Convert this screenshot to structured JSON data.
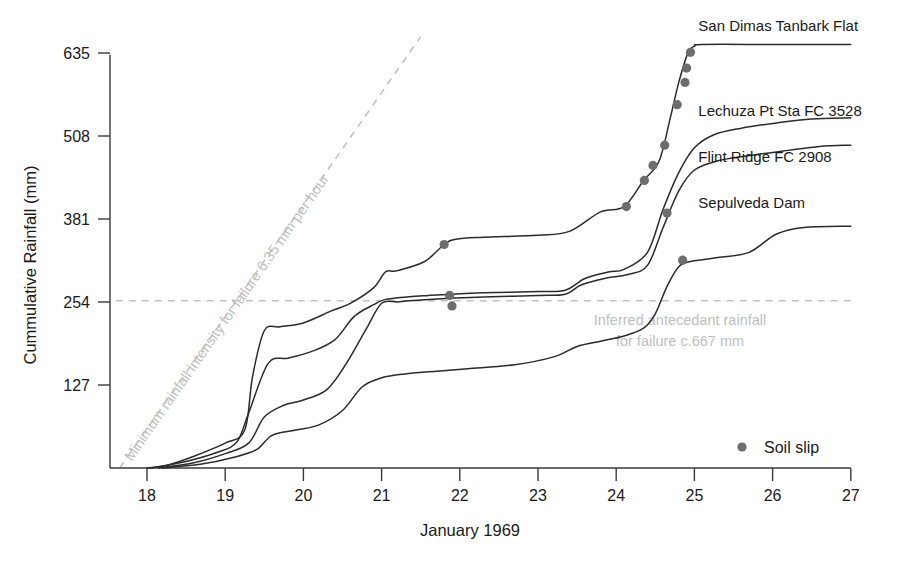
{
  "chart_data": {
    "type": "line",
    "title": "",
    "subtitle": "",
    "xlabel": "January 1969",
    "ylabel": "Cummulative Rainfall (mm)",
    "xlim": [
      17.6,
      27.0
    ],
    "ylim": [
      0,
      660
    ],
    "xticks": [
      "18",
      "19",
      "20",
      "21",
      "22",
      "23",
      "24",
      "25",
      "26",
      "27"
    ],
    "xtick_values": [
      18,
      19,
      20,
      21,
      22,
      23,
      24,
      25,
      26,
      27
    ],
    "yticks": [
      "127",
      "254",
      "381",
      "508",
      "635"
    ],
    "ytick_values": [
      127,
      254,
      381,
      508,
      635
    ],
    "grid": false,
    "legend_position": "bottom-right",
    "series": [
      {
        "name": "San Dimas Tanbark Flat",
        "label_x": 25.05,
        "label_y": 668,
        "points": [
          [
            18.0,
            0
          ],
          [
            18.25,
            4
          ],
          [
            18.6,
            18
          ],
          [
            19.0,
            38
          ],
          [
            19.25,
            58
          ],
          [
            19.35,
            140
          ],
          [
            19.5,
            210
          ],
          [
            19.7,
            216
          ],
          [
            20.0,
            222
          ],
          [
            20.35,
            240
          ],
          [
            20.6,
            252
          ],
          [
            20.9,
            276
          ],
          [
            21.05,
            300
          ],
          [
            21.2,
            302
          ],
          [
            21.55,
            316
          ],
          [
            21.8,
            342
          ],
          [
            21.95,
            350
          ],
          [
            22.3,
            353
          ],
          [
            23.0,
            356
          ],
          [
            23.4,
            362
          ],
          [
            23.8,
            392
          ],
          [
            24.1,
            400
          ],
          [
            24.35,
            440
          ],
          [
            24.55,
            470
          ],
          [
            24.7,
            540
          ],
          [
            24.8,
            590
          ],
          [
            24.92,
            636
          ],
          [
            25.0,
            645
          ],
          [
            25.1,
            648
          ],
          [
            26.0,
            648
          ],
          [
            27.0,
            648
          ]
        ]
      },
      {
        "name": "Lechuza Pt Sta FC 3528",
        "label_x": 25.05,
        "label_y": 538,
        "points": [
          [
            18.05,
            0
          ],
          [
            18.5,
            10
          ],
          [
            18.9,
            24
          ],
          [
            19.15,
            40
          ],
          [
            19.3,
            84
          ],
          [
            19.55,
            160
          ],
          [
            19.8,
            168
          ],
          [
            20.1,
            178
          ],
          [
            20.4,
            196
          ],
          [
            20.65,
            232
          ],
          [
            20.9,
            250
          ],
          [
            21.05,
            258
          ],
          [
            21.35,
            262
          ],
          [
            21.6,
            264
          ],
          [
            21.9,
            266
          ],
          [
            22.3,
            268
          ],
          [
            23.0,
            270
          ],
          [
            23.35,
            272
          ],
          [
            23.6,
            290
          ],
          [
            23.9,
            300
          ],
          [
            24.1,
            304
          ],
          [
            24.4,
            330
          ],
          [
            24.6,
            396
          ],
          [
            24.8,
            452
          ],
          [
            25.0,
            490
          ],
          [
            25.25,
            510
          ],
          [
            25.6,
            520
          ],
          [
            26.05,
            528
          ],
          [
            26.5,
            534
          ],
          [
            27.0,
            536
          ]
        ]
      },
      {
        "name": "Flint Ridge FC 2908",
        "label_x": 25.05,
        "label_y": 468,
        "points": [
          [
            18.15,
            0
          ],
          [
            18.6,
            8
          ],
          [
            19.0,
            22
          ],
          [
            19.3,
            38
          ],
          [
            19.5,
            78
          ],
          [
            19.75,
            96
          ],
          [
            20.0,
            104
          ],
          [
            20.3,
            120
          ],
          [
            20.55,
            160
          ],
          [
            20.8,
            212
          ],
          [
            21.0,
            252
          ],
          [
            21.2,
            254
          ],
          [
            21.35,
            256
          ],
          [
            21.6,
            258
          ],
          [
            21.95,
            260
          ],
          [
            22.4,
            262
          ],
          [
            23.0,
            264
          ],
          [
            23.35,
            266
          ],
          [
            23.55,
            280
          ],
          [
            23.85,
            290
          ],
          [
            24.15,
            296
          ],
          [
            24.4,
            310
          ],
          [
            24.6,
            368
          ],
          [
            24.8,
            424
          ],
          [
            25.0,
            456
          ],
          [
            25.3,
            470
          ],
          [
            25.7,
            478
          ],
          [
            26.2,
            486
          ],
          [
            26.6,
            492
          ],
          [
            27.0,
            494
          ]
        ]
      },
      {
        "name": "Sepulveda Dam",
        "label_x": 25.05,
        "label_y": 398,
        "points": [
          [
            18.2,
            0
          ],
          [
            18.7,
            6
          ],
          [
            19.1,
            16
          ],
          [
            19.4,
            28
          ],
          [
            19.6,
            50
          ],
          [
            19.9,
            58
          ],
          [
            20.2,
            66
          ],
          [
            20.5,
            88
          ],
          [
            20.75,
            124
          ],
          [
            21.0,
            138
          ],
          [
            21.3,
            144
          ],
          [
            21.7,
            148
          ],
          [
            22.1,
            152
          ],
          [
            22.7,
            158
          ],
          [
            23.2,
            170
          ],
          [
            23.5,
            186
          ],
          [
            23.8,
            194
          ],
          [
            24.1,
            202
          ],
          [
            24.35,
            214
          ],
          [
            24.5,
            236
          ],
          [
            24.65,
            278
          ],
          [
            24.8,
            308
          ],
          [
            24.95,
            316
          ],
          [
            25.3,
            322
          ],
          [
            25.7,
            330
          ],
          [
            26.05,
            358
          ],
          [
            26.4,
            368
          ],
          [
            27.0,
            370
          ]
        ]
      }
    ],
    "annotations": [
      {
        "id": "minimum-intensity-guide",
        "kind": "dashed-diagonal-line",
        "text": "Minimum rainfall intensity for failure 6.35 mm per hour",
        "from": [
          17.65,
          0
        ],
        "to": [
          21.5,
          660
        ]
      },
      {
        "id": "inferred-antecedant-guide",
        "kind": "dashed-horizontal-line",
        "text_line1": "Inferred antecedant rainfall",
        "text_line2": "for failure c.667 mm",
        "y_value": 256,
        "from_x": 17.6,
        "to_x": 27.0
      }
    ],
    "markers": {
      "legend_label": "Soil slip",
      "marker_color": "#6d6d6d",
      "marker_shape": "circle",
      "soil_slip_points": [
        [
          21.8,
          342
        ],
        [
          21.87,
          264
        ],
        [
          21.9,
          248
        ],
        [
          24.13,
          400
        ],
        [
          24.36,
          440
        ],
        [
          24.47,
          463
        ],
        [
          24.62,
          494
        ],
        [
          24.65,
          390
        ],
        [
          24.78,
          556
        ],
        [
          24.85,
          318
        ],
        [
          24.88,
          590
        ],
        [
          24.9,
          612
        ],
        [
          24.95,
          636
        ]
      ]
    },
    "colors": {
      "line": "#2b2b2b",
      "axis": "#3a3a3a",
      "guide": "#c2c2c2",
      "annotation_text": "#c0c0c0",
      "marker": "#6d6d6d",
      "background": "#ffffff"
    }
  },
  "legend": {
    "label": "Soil slip"
  }
}
